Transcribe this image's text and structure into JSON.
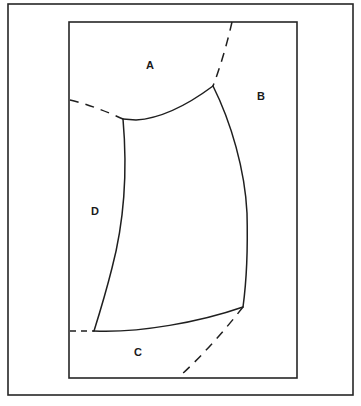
{
  "figure": {
    "background_color": "#ffffff",
    "line_color": "#1f1f1f",
    "frame_color": "#262626",
    "canvas": {
      "width": 361,
      "height": 406
    },
    "outer_frame": {
      "x": 8,
      "y": 4,
      "width": 345,
      "height": 391
    },
    "inner_frame": {
      "x": 69,
      "y": 22,
      "width": 228,
      "height": 356
    },
    "labels": [
      {
        "id": "A",
        "text": "A",
        "x": 150,
        "y": 66
      },
      {
        "id": "B",
        "text": "B",
        "x": 261,
        "y": 97
      },
      {
        "id": "C",
        "text": "C",
        "x": 138,
        "y": 353
      },
      {
        "id": "D",
        "text": "D",
        "x": 95,
        "y": 212
      }
    ],
    "vertices": {
      "top_left_junction": {
        "x": 123,
        "y": 119
      },
      "top_right_junction": {
        "x": 213,
        "y": 86
      },
      "bottom_left_junction": {
        "x": 94,
        "y": 331
      },
      "bottom_right_junction": {
        "x": 243,
        "y": 307
      }
    },
    "curves": [
      {
        "id": "top-arc",
        "style": "solid",
        "path": "M 123 119 L 136 120 Q 170 118 213 86"
      },
      {
        "id": "left-curve",
        "style": "solid",
        "path": "M 123 119 C 127 165 126 215 112 268 C 106 292 99 315 94 331"
      },
      {
        "id": "right-curve",
        "style": "solid",
        "path": "M 213 86 C 231 122 245 170 247 213 C 248 252 246 285 243 307"
      },
      {
        "id": "bottom-arc",
        "style": "solid",
        "path": "M 94 331 C 140 333 200 322 243 307"
      },
      {
        "id": "top-dashed",
        "style": "dashed",
        "path": "M 232 22 C 227 44 220 68 213 86"
      },
      {
        "id": "left-dashed",
        "style": "dashed",
        "path": "M 70 100 C 88 104 110 113 123 119"
      },
      {
        "id": "bottom-left-dashed",
        "style": "dashed-short",
        "path": "M 70 331 L 94 331"
      },
      {
        "id": "bottom-right-dashed",
        "style": "dashed",
        "path": "M 243 307 C 225 330 202 356 181 375"
      }
    ]
  }
}
